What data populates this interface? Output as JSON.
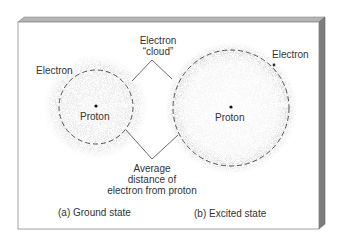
{
  "diagram": {
    "labels": {
      "cloud_line1": "Electron",
      "cloud_line2": "“cloud”",
      "electron_left": "Electron",
      "electron_right": "Electron",
      "proton_left": "Proton",
      "proton_right": "Proton",
      "avg_line1": "Average",
      "avg_line2": "distance of",
      "avg_line3": "electron from proton",
      "caption_a": "(a) Ground state",
      "caption_b": "(b) Excited state"
    },
    "colors": {
      "board_face": "#ffffff",
      "board_edge": "#9a9a9a",
      "board_side": "#7d7d7d",
      "cloud": "#8a8a8a",
      "dashed": "#444444",
      "text": "#333333"
    }
  }
}
